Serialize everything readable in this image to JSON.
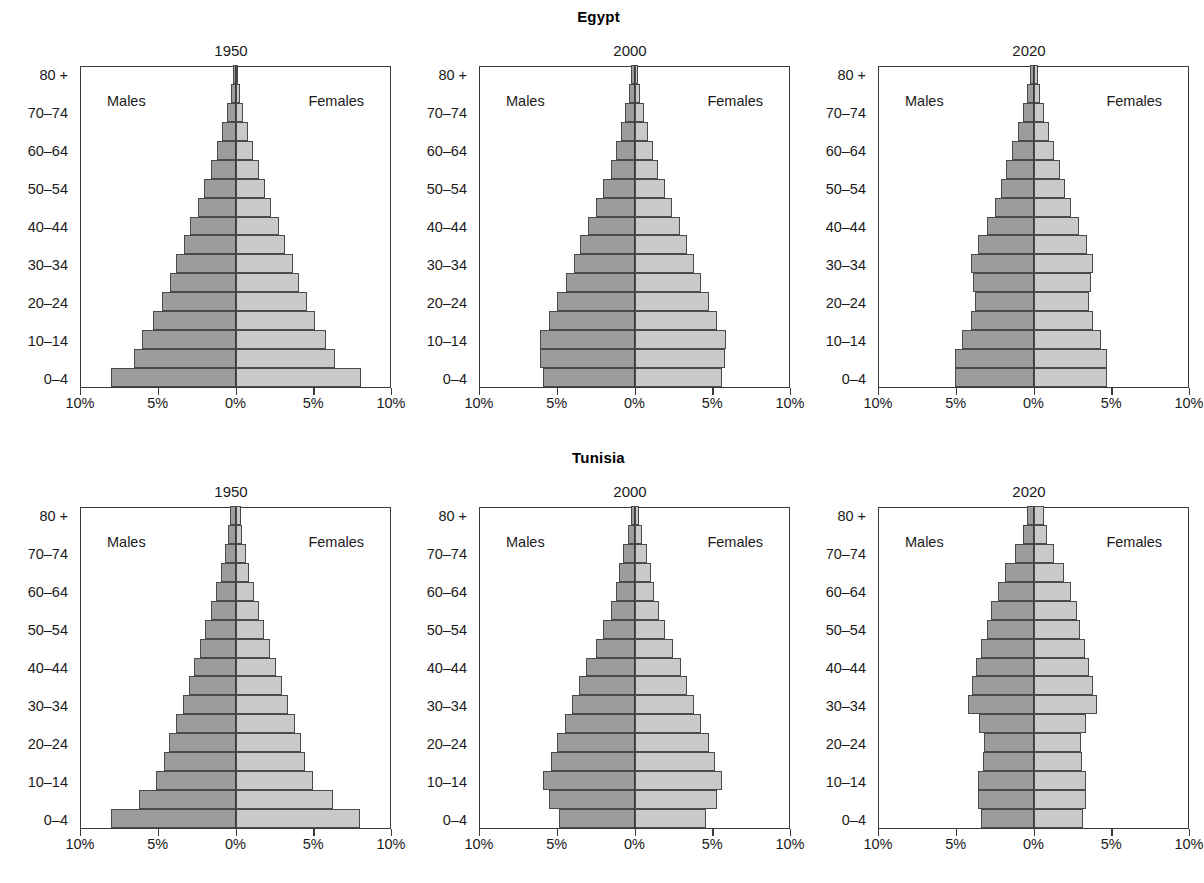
{
  "figure": {
    "axis_labels": {
      "age_groups": [
        "0–4",
        "5–9",
        "10–14",
        "15–19",
        "20–24",
        "25–29",
        "30–34",
        "35–39",
        "40–44",
        "45–49",
        "50–54",
        "55–59",
        "60–64",
        "65–69",
        "70–74",
        "75–79",
        "80 +"
      ],
      "visible_y_ticks": [
        "0–4",
        "10–14",
        "20–24",
        "30–34",
        "40–44",
        "50–54",
        "60–64",
        "70–74",
        "80 +"
      ],
      "x_ticks": [
        "10%",
        "5%",
        "0%",
        "5%",
        "10%"
      ],
      "males_label": "Males",
      "females_label": "Females"
    },
    "colors": {
      "male_fill": "#9c9c9c",
      "female_fill": "#c9c9c9",
      "outline": "#4a4a4a",
      "frame": "#3b3b3b",
      "text": "#1a1a1a",
      "background": "#ffffff"
    }
  },
  "chart_data": [
    {
      "type": "bar",
      "title": "Egypt",
      "subtitle": "1950",
      "country": "Egypt",
      "year": "1950",
      "orientation": "population-pyramid",
      "xlabel": "",
      "ylabel": "",
      "xlim": [
        -10,
        10
      ],
      "xunit": "%",
      "grid": false,
      "categories": [
        "0–4",
        "5–9",
        "10–14",
        "15–19",
        "20–24",
        "25–29",
        "30–34",
        "35–39",
        "40–44",
        "45–49",
        "50–54",
        "55–59",
        "60–64",
        "65–69",
        "70–74",
        "75–79",
        "80 +"
      ],
      "series": [
        {
          "name": "Males",
          "values": [
            8.0,
            6.5,
            6.0,
            5.3,
            4.7,
            4.2,
            3.8,
            3.3,
            2.9,
            2.4,
            2.0,
            1.6,
            1.2,
            0.85,
            0.55,
            0.3,
            0.15
          ]
        },
        {
          "name": "Females",
          "values": [
            8.1,
            6.4,
            5.8,
            5.1,
            4.6,
            4.1,
            3.7,
            3.2,
            2.8,
            2.3,
            1.9,
            1.5,
            1.15,
            0.8,
            0.5,
            0.28,
            0.14
          ]
        }
      ]
    },
    {
      "type": "bar",
      "title": "Egypt",
      "subtitle": "2000",
      "country": "Egypt",
      "year": "2000",
      "orientation": "population-pyramid",
      "xlabel": "",
      "ylabel": "",
      "xlim": [
        -10,
        10
      ],
      "xunit": "%",
      "grid": false,
      "categories": [
        "0–4",
        "5–9",
        "10–14",
        "15–19",
        "20–24",
        "25–29",
        "30–34",
        "35–39",
        "40–44",
        "45–49",
        "50–54",
        "55–59",
        "60–64",
        "65–69",
        "70–74",
        "75–79",
        "80 +"
      ],
      "series": [
        {
          "name": "Males",
          "values": [
            5.9,
            6.1,
            6.1,
            5.5,
            5.0,
            4.4,
            3.9,
            3.5,
            3.0,
            2.5,
            2.0,
            1.5,
            1.2,
            0.9,
            0.6,
            0.35,
            0.2
          ]
        },
        {
          "name": "Females",
          "values": [
            5.6,
            5.8,
            5.9,
            5.3,
            4.8,
            4.3,
            3.8,
            3.4,
            2.9,
            2.4,
            1.95,
            1.5,
            1.2,
            0.9,
            0.6,
            0.36,
            0.22
          ]
        }
      ]
    },
    {
      "type": "bar",
      "title": "Egypt",
      "subtitle": "2020",
      "country": "Egypt",
      "year": "2020",
      "orientation": "population-pyramid",
      "xlabel": "",
      "ylabel": "",
      "xlim": [
        -10,
        10
      ],
      "xunit": "%",
      "grid": false,
      "categories": [
        "0–4",
        "5–9",
        "10–14",
        "15–19",
        "20–24",
        "25–29",
        "30–34",
        "35–39",
        "40–44",
        "45–49",
        "50–54",
        "55–59",
        "60–64",
        "65–69",
        "70–74",
        "75–79",
        "80 +"
      ],
      "series": [
        {
          "name": "Males",
          "values": [
            5.05,
            5.05,
            4.6,
            4.0,
            3.75,
            3.9,
            4.0,
            3.6,
            3.0,
            2.45,
            2.1,
            1.75,
            1.4,
            1.0,
            0.65,
            0.4,
            0.25
          ]
        },
        {
          "name": "Females",
          "values": [
            4.75,
            4.75,
            4.35,
            3.8,
            3.55,
            3.7,
            3.85,
            3.45,
            2.9,
            2.4,
            2.05,
            1.7,
            1.35,
            1.0,
            0.7,
            0.42,
            0.3
          ]
        }
      ]
    },
    {
      "type": "bar",
      "title": "Tunisia",
      "subtitle": "1950",
      "country": "Tunisia",
      "year": "1950",
      "orientation": "population-pyramid",
      "xlabel": "",
      "ylabel": "",
      "xlim": [
        -10,
        10
      ],
      "xunit": "%",
      "grid": false,
      "categories": [
        "0–4",
        "5–9",
        "10–14",
        "15–19",
        "20–24",
        "25–29",
        "30–34",
        "35–39",
        "40–44",
        "45–49",
        "50–54",
        "55–59",
        "60–64",
        "65–69",
        "70–74",
        "75–79",
        "80 +"
      ],
      "series": [
        {
          "name": "Males",
          "values": [
            8.0,
            6.2,
            5.1,
            4.6,
            4.3,
            3.8,
            3.4,
            3.0,
            2.7,
            2.3,
            1.95,
            1.6,
            1.25,
            0.95,
            0.7,
            0.5,
            0.35
          ]
        },
        {
          "name": "Females",
          "values": [
            8.0,
            6.3,
            5.0,
            4.5,
            4.2,
            3.8,
            3.4,
            3.0,
            2.6,
            2.2,
            1.85,
            1.5,
            1.2,
            0.9,
            0.65,
            0.45,
            0.35
          ]
        }
      ]
    },
    {
      "type": "bar",
      "title": "Tunisia",
      "subtitle": "2000",
      "country": "Tunisia",
      "year": "2000",
      "orientation": "population-pyramid",
      "xlabel": "",
      "ylabel": "",
      "xlim": [
        -10,
        10
      ],
      "xunit": "%",
      "grid": false,
      "categories": [
        "0–4",
        "5–9",
        "10–14",
        "15–19",
        "20–24",
        "25–29",
        "30–34",
        "35–39",
        "40–44",
        "45–49",
        "50–54",
        "55–59",
        "60–64",
        "65–69",
        "70–74",
        "75–79",
        "80 +"
      ],
      "series": [
        {
          "name": "Males",
          "values": [
            4.85,
            5.5,
            5.9,
            5.4,
            5.0,
            4.5,
            4.0,
            3.6,
            3.1,
            2.5,
            2.0,
            1.5,
            1.2,
            1.0,
            0.75,
            0.45,
            0.25
          ]
        },
        {
          "name": "Females",
          "values": [
            4.6,
            5.3,
            5.65,
            5.2,
            4.8,
            4.3,
            3.8,
            3.4,
            3.0,
            2.45,
            1.95,
            1.55,
            1.25,
            1.05,
            0.8,
            0.5,
            0.3
          ]
        }
      ]
    },
    {
      "type": "bar",
      "title": "Tunisia",
      "subtitle": "2020",
      "country": "Tunisia",
      "year": "2020",
      "orientation": "population-pyramid",
      "xlabel": "",
      "ylabel": "",
      "xlim": [
        -10,
        10
      ],
      "xunit": "%",
      "grid": false,
      "categories": [
        "0–4",
        "5–9",
        "10–14",
        "15–19",
        "20–24",
        "25–29",
        "30–34",
        "35–39",
        "40–44",
        "45–49",
        "50–54",
        "55–59",
        "60–64",
        "65–69",
        "70–74",
        "75–79",
        "80 +"
      ],
      "series": [
        {
          "name": "Males",
          "values": [
            3.4,
            3.55,
            3.6,
            3.25,
            3.2,
            3.5,
            4.2,
            3.95,
            3.7,
            3.35,
            3.0,
            2.75,
            2.3,
            1.85,
            1.2,
            0.7,
            0.45
          ]
        },
        {
          "name": "Females",
          "values": [
            3.2,
            3.35,
            3.4,
            3.1,
            3.05,
            3.4,
            4.1,
            3.85,
            3.6,
            3.3,
            3.0,
            2.8,
            2.4,
            1.95,
            1.35,
            0.85,
            0.65
          ]
        }
      ]
    }
  ]
}
